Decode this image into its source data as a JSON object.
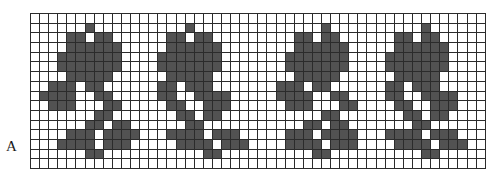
{
  "figure": {
    "label": "A",
    "caption_position": "bottom-left"
  },
  "chart_data": {
    "type": "heatmap",
    "title": "A",
    "xlabel": "",
    "ylabel": "",
    "columns": 50,
    "rows": 16,
    "legend": [
      {
        "key": "0",
        "label": "empty stitch",
        "color": "#ffffff"
      },
      {
        "key": "1",
        "label": "filled stitch",
        "color": "#525252"
      }
    ],
    "colors": {
      "filled": "#525252",
      "empty": "#ffffff",
      "grid_line": "#2b2b2b",
      "border": "#1c1c1c"
    },
    "grid": true,
    "cell_px": 8.64,
    "motif_repeat_columns": 13,
    "motif_count": 4,
    "motif_sequence": [
      "A",
      "B",
      "A",
      "B"
    ],
    "values": [
      [
        0,
        0,
        0,
        0,
        0,
        0,
        0,
        0,
        0,
        0,
        0,
        0,
        0,
        0,
        0,
        0,
        0,
        0,
        0,
        0,
        0,
        0,
        0,
        0,
        0,
        0,
        0,
        0,
        0,
        0,
        0,
        0,
        0,
        0,
        0,
        0,
        0,
        0,
        0,
        0,
        0,
        0,
        0,
        0,
        0,
        0,
        0,
        0,
        0,
        0
      ],
      [
        0,
        0,
        0,
        0,
        0,
        0,
        1,
        0,
        0,
        0,
        0,
        0,
        0,
        0,
        0,
        0,
        0,
        1,
        0,
        0,
        0,
        0,
        0,
        0,
        0,
        0,
        0,
        0,
        0,
        0,
        0,
        0,
        1,
        0,
        0,
        0,
        0,
        0,
        0,
        0,
        0,
        0,
        0,
        1,
        0,
        0,
        0,
        0,
        0,
        0
      ],
      [
        0,
        0,
        0,
        0,
        1,
        1,
        0,
        1,
        1,
        0,
        0,
        0,
        0,
        0,
        0,
        1,
        1,
        0,
        1,
        1,
        0,
        0,
        0,
        0,
        0,
        0,
        0,
        0,
        0,
        1,
        1,
        0,
        1,
        1,
        0,
        0,
        0,
        0,
        0,
        0,
        1,
        1,
        0,
        1,
        1,
        0,
        0,
        0,
        0,
        0
      ],
      [
        0,
        0,
        0,
        0,
        1,
        1,
        1,
        1,
        1,
        1,
        0,
        0,
        0,
        0,
        0,
        1,
        1,
        1,
        1,
        1,
        1,
        0,
        0,
        0,
        0,
        0,
        0,
        0,
        0,
        1,
        1,
        1,
        1,
        1,
        1,
        0,
        0,
        0,
        0,
        0,
        1,
        1,
        1,
        1,
        1,
        1,
        0,
        0,
        0,
        0
      ],
      [
        0,
        0,
        0,
        1,
        1,
        1,
        1,
        1,
        1,
        1,
        0,
        0,
        0,
        0,
        1,
        1,
        1,
        1,
        1,
        1,
        1,
        0,
        0,
        0,
        0,
        0,
        0,
        0,
        1,
        1,
        1,
        1,
        1,
        1,
        1,
        0,
        0,
        0,
        0,
        1,
        1,
        1,
        1,
        1,
        1,
        1,
        0,
        0,
        0,
        0
      ],
      [
        0,
        0,
        0,
        1,
        1,
        1,
        1,
        1,
        1,
        1,
        0,
        0,
        0,
        0,
        1,
        1,
        1,
        1,
        1,
        1,
        1,
        0,
        0,
        0,
        0,
        0,
        0,
        0,
        1,
        1,
        1,
        1,
        1,
        1,
        1,
        0,
        0,
        0,
        0,
        1,
        1,
        1,
        1,
        1,
        1,
        1,
        0,
        0,
        0,
        0
      ],
      [
        0,
        0,
        0,
        0,
        1,
        1,
        1,
        1,
        1,
        0,
        0,
        0,
        0,
        0,
        0,
        1,
        1,
        1,
        1,
        1,
        0,
        0,
        0,
        0,
        0,
        0,
        0,
        0,
        0,
        1,
        1,
        1,
        1,
        1,
        0,
        0,
        0,
        0,
        0,
        0,
        1,
        1,
        1,
        1,
        1,
        0,
        0,
        0,
        0,
        0
      ],
      [
        0,
        0,
        1,
        1,
        1,
        0,
        1,
        1,
        0,
        0,
        0,
        0,
        0,
        0,
        1,
        1,
        0,
        1,
        1,
        1,
        0,
        0,
        0,
        0,
        0,
        0,
        0,
        1,
        1,
        1,
        0,
        1,
        1,
        0,
        0,
        0,
        0,
        0,
        0,
        1,
        1,
        0,
        1,
        1,
        1,
        0,
        0,
        0,
        0,
        0
      ],
      [
        0,
        1,
        1,
        1,
        1,
        0,
        0,
        1,
        1,
        0,
        0,
        0,
        0,
        0,
        1,
        1,
        0,
        0,
        1,
        1,
        1,
        1,
        0,
        0,
        0,
        0,
        0,
        1,
        1,
        1,
        1,
        0,
        0,
        1,
        1,
        0,
        0,
        0,
        0,
        1,
        1,
        0,
        0,
        1,
        1,
        1,
        1,
        0,
        0,
        0
      ],
      [
        0,
        0,
        1,
        1,
        1,
        0,
        0,
        0,
        1,
        1,
        0,
        0,
        0,
        0,
        0,
        1,
        1,
        0,
        0,
        1,
        1,
        1,
        0,
        0,
        0,
        0,
        0,
        0,
        1,
        1,
        1,
        0,
        0,
        0,
        1,
        1,
        0,
        0,
        0,
        0,
        1,
        1,
        0,
        0,
        1,
        1,
        1,
        0,
        0,
        0
      ],
      [
        0,
        0,
        0,
        0,
        0,
        0,
        0,
        1,
        1,
        0,
        0,
        0,
        0,
        0,
        0,
        0,
        1,
        1,
        0,
        1,
        1,
        0,
        0,
        0,
        0,
        0,
        0,
        0,
        0,
        0,
        0,
        0,
        1,
        1,
        0,
        0,
        0,
        0,
        0,
        0,
        0,
        1,
        1,
        0,
        1,
        1,
        0,
        0,
        0,
        0
      ],
      [
        0,
        0,
        0,
        0,
        0,
        0,
        1,
        1,
        0,
        1,
        1,
        0,
        0,
        0,
        0,
        0,
        0,
        1,
        1,
        0,
        0,
        0,
        0,
        0,
        0,
        0,
        0,
        0,
        0,
        0,
        1,
        1,
        0,
        1,
        1,
        0,
        0,
        0,
        0,
        0,
        0,
        0,
        1,
        1,
        0,
        0,
        0,
        0,
        0,
        0
      ],
      [
        0,
        0,
        0,
        0,
        1,
        1,
        1,
        0,
        1,
        1,
        1,
        1,
        0,
        0,
        0,
        1,
        1,
        1,
        1,
        0,
        1,
        1,
        1,
        0,
        0,
        0,
        0,
        0,
        1,
        1,
        1,
        0,
        1,
        1,
        1,
        1,
        0,
        0,
        0,
        1,
        1,
        1,
        1,
        0,
        1,
        1,
        1,
        0,
        0,
        0
      ],
      [
        0,
        0,
        0,
        1,
        1,
        1,
        1,
        0,
        1,
        1,
        1,
        0,
        0,
        0,
        0,
        0,
        1,
        1,
        1,
        1,
        0,
        1,
        1,
        1,
        0,
        0,
        0,
        0,
        1,
        1,
        1,
        1,
        0,
        1,
        1,
        1,
        0,
        0,
        0,
        0,
        1,
        1,
        1,
        1,
        0,
        1,
        1,
        1,
        0,
        0
      ],
      [
        0,
        0,
        0,
        0,
        0,
        0,
        1,
        1,
        0,
        0,
        0,
        0,
        0,
        0,
        0,
        0,
        0,
        0,
        0,
        1,
        1,
        0,
        0,
        0,
        0,
        0,
        0,
        0,
        0,
        0,
        0,
        1,
        1,
        0,
        0,
        0,
        0,
        0,
        0,
        0,
        0,
        0,
        0,
        1,
        1,
        0,
        0,
        0,
        0,
        0
      ],
      [
        0,
        0,
        0,
        0,
        0,
        0,
        0,
        0,
        0,
        0,
        0,
        0,
        0,
        0,
        0,
        0,
        0,
        0,
        0,
        0,
        0,
        0,
        0,
        0,
        0,
        0,
        0,
        0,
        0,
        0,
        0,
        0,
        0,
        0,
        0,
        0,
        0,
        0,
        0,
        0,
        0,
        0,
        0,
        0,
        0,
        0,
        0,
        0,
        0,
        0
      ]
    ]
  }
}
